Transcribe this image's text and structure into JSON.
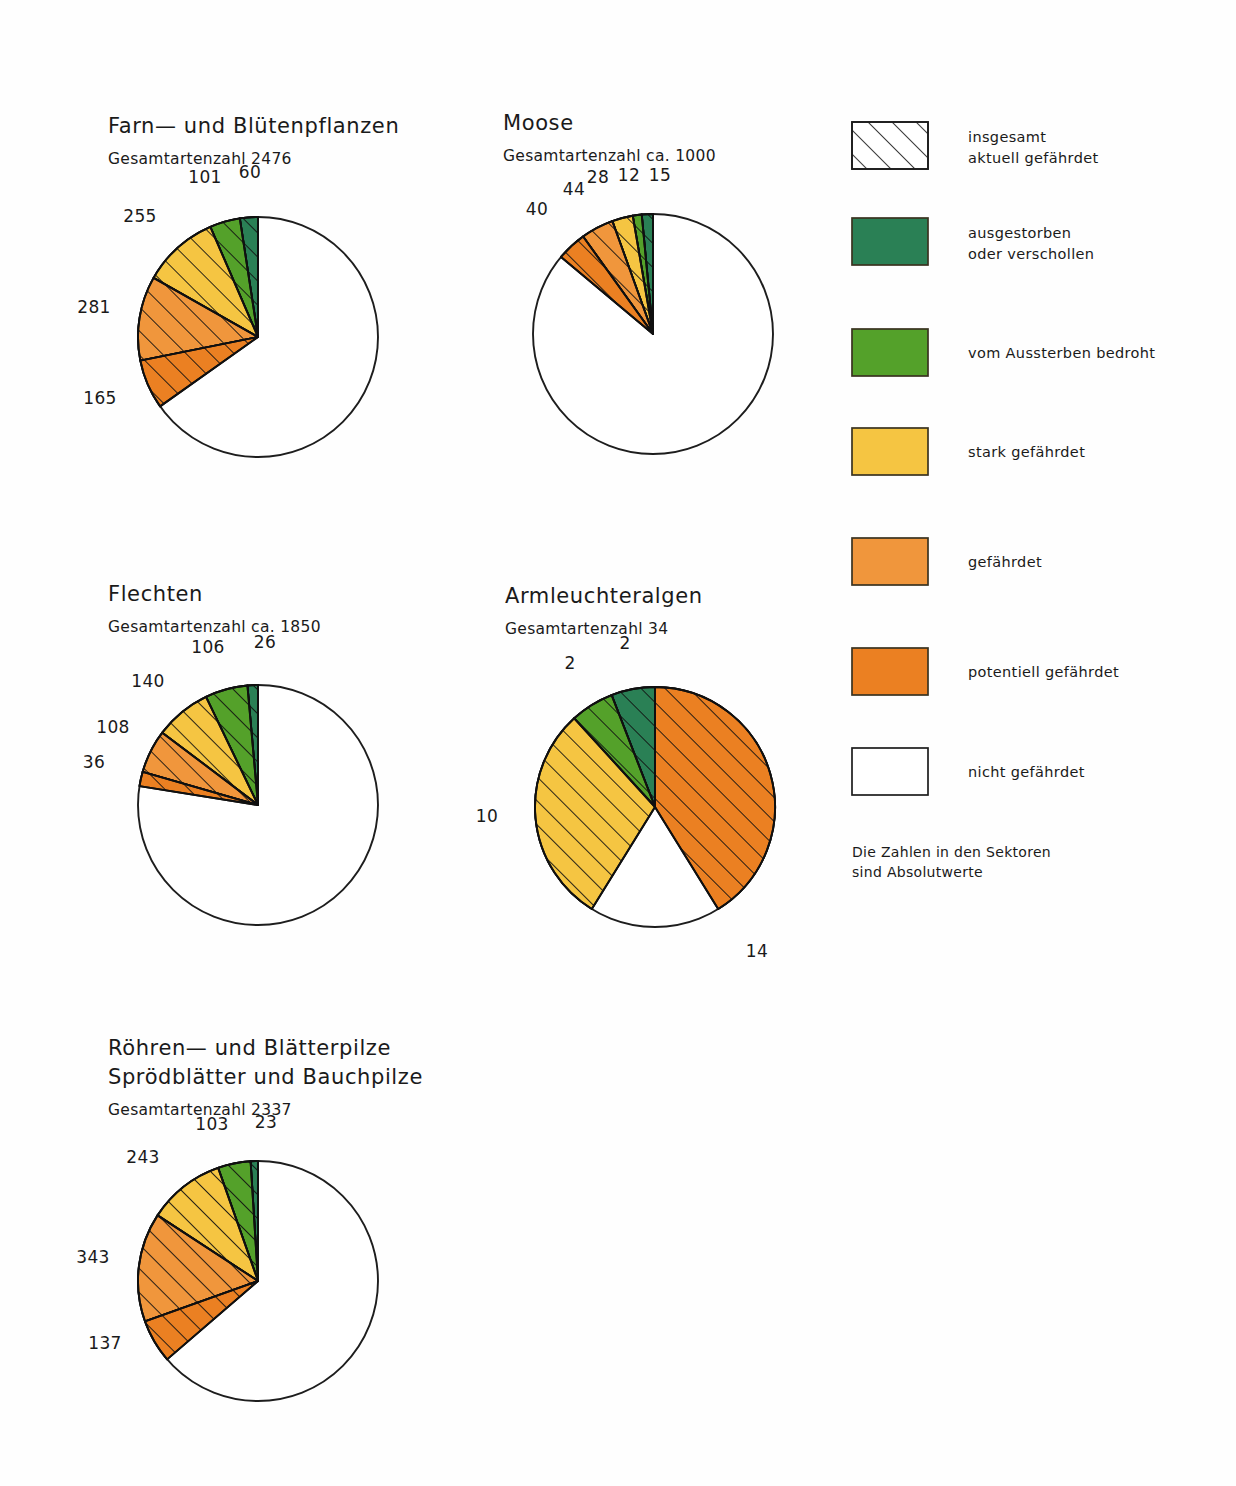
{
  "figure": {
    "note_lines": [
      "Die Zahlen in den Sektoren",
      "sind Absolutwerte"
    ]
  },
  "legend": {
    "items": [
      {
        "label_lines": [
          "insgesamt",
          "aktuell gefährdet"
        ],
        "style": "hatched",
        "color": "#ffffff"
      },
      {
        "label_lines": [
          "ausgestorben",
          "oder verschollen"
        ],
        "style": "solid",
        "color": "#2a8055"
      },
      {
        "label_lines": [
          "vom Aussterben bedroht"
        ],
        "style": "solid",
        "color": "#54a12a"
      },
      {
        "label_lines": [
          "stark gefährdet"
        ],
        "style": "solid",
        "color": "#f5c542"
      },
      {
        "label_lines": [
          "gefährdet"
        ],
        "style": "solid",
        "color": "#f0963c"
      },
      {
        "label_lines": [
          "potentiell gefährdet"
        ],
        "style": "solid",
        "color": "#eb8022"
      },
      {
        "label_lines": [
          "nicht gefährdet"
        ],
        "style": "plain",
        "color": "#ffffff"
      }
    ]
  },
  "chart_data": [
    {
      "type": "pie",
      "title": "Farn— und Blütenpflanzen",
      "subtitle": "Gesamtartenzahl 2476",
      "total": 2476,
      "center": [
        258,
        337
      ],
      "radius": 120,
      "categories": [
        "ausgestorben oder verschollen",
        "vom Aussterben bedroht",
        "stark gefährdet",
        "gefährdet",
        "potentiell gefährdet",
        "nicht gefährdet"
      ],
      "values": [
        60,
        101,
        255,
        281,
        165,
        1614
      ],
      "colors": [
        "#2a8055",
        "#54a12a",
        "#f5c542",
        "#f0963c",
        "#eb8022",
        "#ffffff"
      ],
      "labels": [
        "60",
        "101",
        "255",
        "281",
        "165"
      ],
      "label_positions": [
        [
          250,
          178
        ],
        [
          205,
          183
        ],
        [
          140,
          222
        ],
        [
          94,
          313
        ],
        [
          100,
          404
        ]
      ]
    },
    {
      "type": "pie",
      "title": "Moose",
      "subtitle": "Gesamtartenzahl ca. 1000",
      "total": 1000,
      "center": [
        653,
        334
      ],
      "radius": 120,
      "categories": [
        "ausgestorben oder verschollen",
        "vom Aussterben bedroht",
        "stark gefährdet",
        "gefährdet",
        "potentiell gefährdet",
        "nicht gefährdet"
      ],
      "values": [
        15,
        12,
        28,
        44,
        40,
        861
      ],
      "colors": [
        "#2a8055",
        "#54a12a",
        "#f5c542",
        "#f0963c",
        "#eb8022",
        "#ffffff"
      ],
      "labels": [
        "15",
        "12",
        "28",
        "44",
        "40"
      ],
      "label_positions": [
        [
          660,
          181
        ],
        [
          629,
          181
        ],
        [
          598,
          183
        ],
        [
          574,
          195
        ],
        [
          537,
          215
        ]
      ]
    },
    {
      "type": "pie",
      "title": "Flechten",
      "subtitle": "Gesamtartenzahl ca. 1850",
      "total": 1850,
      "center": [
        258,
        805
      ],
      "radius": 120,
      "categories": [
        "ausgestorben oder verschollen",
        "vom Aussterben bedroht",
        "stark gefährdet",
        "gefährdet",
        "potentiell gefährdet",
        "nicht gefährdet"
      ],
      "values": [
        26,
        106,
        140,
        108,
        36,
        1434
      ],
      "colors": [
        "#2a8055",
        "#54a12a",
        "#f5c542",
        "#f0963c",
        "#eb8022",
        "#ffffff"
      ],
      "labels": [
        "26",
        "106",
        "140",
        "108",
        "36"
      ],
      "label_positions": [
        [
          265,
          648
        ],
        [
          208,
          653
        ],
        [
          148,
          687
        ],
        [
          113,
          733
        ],
        [
          94,
          768
        ]
      ]
    },
    {
      "type": "pie",
      "title": "Armleuchteralgen",
      "subtitle": "Gesamtartenzahl 34",
      "total": 34,
      "center": [
        655,
        807
      ],
      "radius": 120,
      "categories": [
        "ausgestorben oder verschollen",
        "vom Aussterben bedroht",
        "stark gefährdet",
        "potentiell gefährdet",
        "nicht gefährdet"
      ],
      "values": [
        2,
        2,
        10,
        14,
        6
      ],
      "colors": [
        "#2a8055",
        "#54a12a",
        "#f5c542",
        "#eb8022",
        "#ffffff"
      ],
      "labels": [
        "2",
        "2",
        "10",
        "14"
      ],
      "label_positions": [
        [
          625,
          649
        ],
        [
          570,
          669
        ],
        [
          487,
          822
        ],
        [
          757,
          957
        ]
      ]
    },
    {
      "type": "pie",
      "title_lines": [
        "Röhren— und Blätterpilze",
        "Sprödblätter und Bauchpilze"
      ],
      "title": "Röhren— und Blätterpilze Sprödblätter und Bauchpilze",
      "subtitle": "Gesamtartenzahl 2337",
      "total": 2337,
      "center": [
        258,
        1281
      ],
      "radius": 120,
      "categories": [
        "ausgestorben oder verschollen",
        "vom Aussterben bedroht",
        "stark gefährdet",
        "gefährdet",
        "potentiell gefährdet",
        "nicht gefährdet"
      ],
      "values": [
        23,
        103,
        243,
        343,
        137,
        1488
      ],
      "colors": [
        "#2a8055",
        "#54a12a",
        "#f5c542",
        "#f0963c",
        "#eb8022",
        "#ffffff"
      ],
      "labels": [
        "23",
        "103",
        "243",
        "137",
        "343"
      ],
      "label_positions": [
        [
          266,
          1128
        ],
        [
          212,
          1130
        ],
        [
          143,
          1163
        ],
        [
          105,
          1349
        ],
        [
          93,
          1263
        ]
      ]
    }
  ]
}
